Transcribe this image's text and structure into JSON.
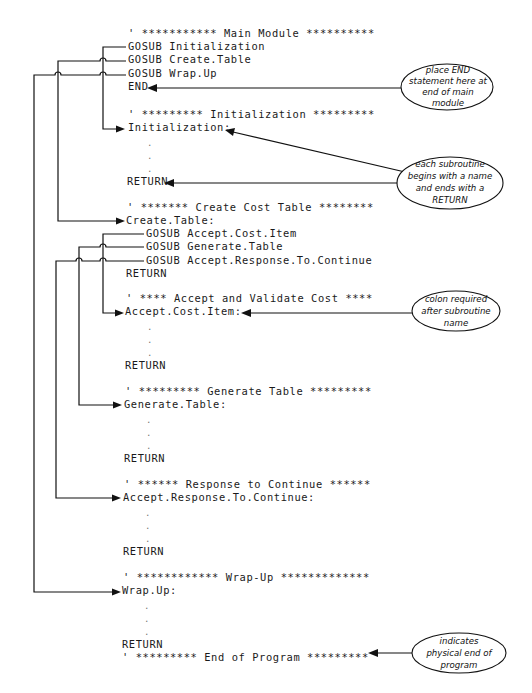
{
  "code_lines": [
    {
      "id": "main-comment",
      "text": "' *********** Main Module **********"
    },
    {
      "id": "gosub-initialization",
      "text": "GOSUB Initialization"
    },
    {
      "id": "gosub-create-table",
      "text": "GOSUB Create.Table"
    },
    {
      "id": "gosub-wrap-up",
      "text": "GOSUB Wrap.Up"
    },
    {
      "id": "end-statement",
      "text": "END"
    },
    {
      "id": "init-comment",
      "text": "' ********* Initialization *********"
    },
    {
      "id": "init-label",
      "text": "Initialization:"
    },
    {
      "id": "init-return",
      "text": "RETURN"
    },
    {
      "id": "create-comment",
      "text": "' ******* Create Cost Table ********"
    },
    {
      "id": "create-label",
      "text": "Create.Table:"
    },
    {
      "id": "gosub-accept-cost-item",
      "text": "GOSUB Accept.Cost.Item"
    },
    {
      "id": "gosub-generate-table",
      "text": "GOSUB Generate.Table"
    },
    {
      "id": "gosub-accept-response",
      "text": "GOSUB Accept.Response.To.Continue"
    },
    {
      "id": "create-return",
      "text": "RETURN"
    },
    {
      "id": "accept-comment",
      "text": "' **** Accept and Validate Cost ****"
    },
    {
      "id": "accept-label",
      "text": "Accept.Cost.Item:"
    },
    {
      "id": "accept-return",
      "text": "RETURN"
    },
    {
      "id": "generate-comment",
      "text": "' ********* Generate Table *********"
    },
    {
      "id": "generate-label",
      "text": "Generate.Table:"
    },
    {
      "id": "generate-return",
      "text": "RETURN"
    },
    {
      "id": "response-comment",
      "text": "' ****** Response to Continue ******"
    },
    {
      "id": "response-label",
      "text": "Accept.Response.To.Continue:"
    },
    {
      "id": "response-return",
      "text": "RETURN"
    },
    {
      "id": "wrapup-comment",
      "text": "' ************ Wrap-Up *************"
    },
    {
      "id": "wrapup-label",
      "text": "Wrap.Up:"
    },
    {
      "id": "wrapup-return",
      "text": "RETURN"
    },
    {
      "id": "end-comment",
      "text": "' ********* End of Program *********"
    }
  ],
  "ellipsis_dot": ".",
  "callouts": [
    {
      "id": "end-note",
      "lines": [
        "place END",
        "statement here at",
        "end of main",
        "module"
      ]
    },
    {
      "id": "subroutine-note",
      "lines": [
        "each subroutine",
        "begins with a name",
        "and ends with a",
        "RETURN"
      ]
    },
    {
      "id": "colon-note",
      "lines": [
        "colon required",
        "after subroutine",
        "name"
      ]
    },
    {
      "id": "physical-end-note",
      "lines": [
        "indicates",
        "physical end of",
        "program"
      ]
    }
  ]
}
